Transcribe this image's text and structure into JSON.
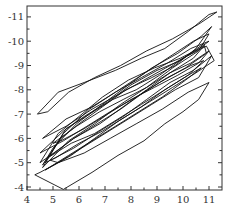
{
  "chart_data": {
    "type": "line",
    "title": "",
    "xlabel": "",
    "ylabel": "",
    "xlim": [
      4,
      11.5
    ],
    "ylim": [
      -3.8,
      -11.4
    ],
    "y_axis_inverted": true,
    "grid": false,
    "legend": null,
    "x_ticks": [
      4,
      5,
      6,
      7,
      8,
      9,
      10,
      11
    ],
    "x_tick_labels": [
      "4",
      "5",
      "6",
      "7",
      "8",
      "9",
      "10",
      "11"
    ],
    "y_ticks": [
      -4,
      -5,
      -6,
      -7,
      -8,
      -9,
      -10,
      -11
    ],
    "y_tick_labels": [
      "-4",
      "-5",
      "-6",
      "-7",
      "-8",
      "-9",
      "-10",
      "-11"
    ],
    "line_color": "#111111",
    "series": [
      {
        "name": "outer-upper-loop",
        "x": [
          4.4,
          5.2,
          6.2,
          7.4,
          8.4,
          9.3,
          10.2,
          11.0,
          11.3,
          10.6,
          9.6,
          8.6,
          7.6,
          6.6,
          5.6,
          4.8,
          4.4
        ],
        "y": [
          -7.0,
          -7.9,
          -8.3,
          -8.8,
          -9.3,
          -9.7,
          -10.4,
          -11.1,
          -11.2,
          -10.7,
          -10.1,
          -9.6,
          -9.0,
          -8.5,
          -7.9,
          -7.1,
          -7.0
        ]
      },
      {
        "name": "outer-lower-loop",
        "x": [
          4.3,
          5.4,
          6.5,
          7.5,
          8.5,
          9.3,
          10.0,
          10.6,
          11.0,
          10.2,
          9.2,
          8.2,
          7.2,
          6.2,
          5.2,
          4.5,
          4.3
        ],
        "y": [
          -4.5,
          -3.9,
          -4.6,
          -5.3,
          -5.9,
          -6.6,
          -7.1,
          -7.6,
          -8.3,
          -7.9,
          -7.2,
          -6.6,
          -6.0,
          -5.4,
          -5.0,
          -4.6,
          -4.5
        ]
      },
      {
        "name": "loop-3",
        "x": [
          4.6,
          5.6,
          6.6,
          7.6,
          8.6,
          9.6,
          10.6,
          11.0,
          10.4,
          9.4,
          8.4,
          7.4,
          6.4,
          5.4,
          4.6
        ],
        "y": [
          -4.8,
          -5.9,
          -6.6,
          -7.4,
          -8.1,
          -8.9,
          -9.6,
          -10.3,
          -10.0,
          -9.3,
          -8.6,
          -7.9,
          -7.2,
          -6.2,
          -4.8
        ]
      },
      {
        "name": "loop-4",
        "x": [
          4.7,
          5.5,
          6.4,
          7.3,
          8.2,
          9.1,
          10.0,
          10.9,
          11.2,
          10.5,
          9.6,
          8.7,
          7.8,
          6.9,
          6.0,
          5.1,
          4.7
        ],
        "y": [
          -5.0,
          -6.4,
          -7.0,
          -7.6,
          -8.0,
          -8.6,
          -9.3,
          -9.8,
          -9.2,
          -8.7,
          -8.1,
          -7.5,
          -6.9,
          -6.3,
          -5.8,
          -5.2,
          -5.0
        ]
      },
      {
        "name": "loop-5",
        "x": [
          4.6,
          5.3,
          6.0,
          6.9,
          7.8,
          8.8,
          9.7,
          10.5,
          11.1,
          10.7,
          9.8,
          8.8,
          7.9,
          6.9,
          5.9,
          5.0,
          4.6
        ],
        "y": [
          -4.9,
          -6.0,
          -6.6,
          -7.3,
          -8.0,
          -8.5,
          -9.0,
          -9.7,
          -10.6,
          -10.2,
          -9.5,
          -8.9,
          -8.2,
          -7.4,
          -6.6,
          -5.6,
          -4.9
        ]
      },
      {
        "name": "loop-6",
        "x": [
          4.8,
          5.7,
          6.6,
          7.5,
          8.4,
          9.3,
          10.2,
          10.8,
          10.3,
          9.4,
          8.5,
          7.6,
          6.7,
          5.8,
          4.8
        ],
        "y": [
          -5.2,
          -5.8,
          -6.2,
          -6.8,
          -7.4,
          -8.0,
          -8.6,
          -9.2,
          -9.0,
          -8.5,
          -7.9,
          -7.2,
          -6.6,
          -6.0,
          -5.2
        ]
      },
      {
        "name": "loop-7",
        "x": [
          4.5,
          5.4,
          6.2,
          7.1,
          8.0,
          9.0,
          9.9,
          10.8,
          10.9,
          10.1,
          9.1,
          8.2,
          7.2,
          6.3,
          5.4,
          4.5
        ],
        "y": [
          -5.4,
          -6.3,
          -6.9,
          -7.5,
          -8.2,
          -8.8,
          -9.2,
          -9.9,
          -9.5,
          -8.9,
          -8.3,
          -7.7,
          -7.1,
          -6.5,
          -5.9,
          -5.4
        ]
      },
      {
        "name": "loop-8",
        "x": [
          4.9,
          5.8,
          6.8,
          7.7,
          8.6,
          9.5,
          10.4,
          11.1,
          10.6,
          9.7,
          8.8,
          7.9,
          7.0,
          6.1,
          5.2,
          4.9
        ],
        "y": [
          -5.1,
          -5.6,
          -6.3,
          -6.9,
          -7.6,
          -8.3,
          -8.8,
          -9.4,
          -8.5,
          -8.0,
          -7.4,
          -6.8,
          -6.2,
          -5.6,
          -5.0,
          -5.1
        ]
      },
      {
        "name": "loop-9",
        "x": [
          4.6,
          5.5,
          6.5,
          7.4,
          8.4,
          9.4,
          10.3,
          11.0,
          10.5,
          9.5,
          8.5,
          7.5,
          6.5,
          5.5,
          4.6
        ],
        "y": [
          -6.0,
          -6.8,
          -7.3,
          -7.9,
          -8.5,
          -9.1,
          -9.7,
          -10.0,
          -9.6,
          -9.0,
          -8.4,
          -7.8,
          -7.2,
          -6.5,
          -6.0
        ]
      },
      {
        "name": "loop-10",
        "x": [
          4.7,
          5.6,
          6.5,
          7.4,
          8.3,
          9.2,
          10.1,
          10.7,
          10.2,
          9.3,
          8.4,
          7.5,
          6.6,
          5.7,
          4.7
        ],
        "y": [
          -4.7,
          -5.3,
          -5.9,
          -6.5,
          -7.1,
          -7.7,
          -8.4,
          -8.9,
          -8.6,
          -8.0,
          -7.3,
          -6.7,
          -6.0,
          -5.3,
          -4.7
        ]
      },
      {
        "name": "loop-11",
        "x": [
          5.0,
          5.9,
          6.8,
          7.7,
          8.6,
          9.5,
          10.3,
          11.0,
          10.6,
          9.8,
          8.9,
          8.0,
          7.1,
          6.2,
          5.3,
          5.0
        ],
        "y": [
          -5.8,
          -6.5,
          -7.1,
          -7.6,
          -8.1,
          -8.7,
          -9.1,
          -9.6,
          -9.1,
          -8.6,
          -8.1,
          -7.6,
          -7.0,
          -6.4,
          -5.9,
          -5.8
        ]
      },
      {
        "name": "loop-12",
        "x": [
          4.5,
          5.2,
          6.0,
          6.9,
          7.9,
          8.9,
          9.9,
          10.8,
          10.4,
          9.5,
          8.6,
          7.7,
          6.8,
          5.8,
          4.9,
          4.5
        ],
        "y": [
          -5.0,
          -6.2,
          -6.9,
          -7.7,
          -8.4,
          -8.9,
          -9.3,
          -9.8,
          -9.3,
          -8.7,
          -8.0,
          -7.3,
          -6.6,
          -6.0,
          -5.3,
          -5.0
        ]
      }
    ]
  }
}
